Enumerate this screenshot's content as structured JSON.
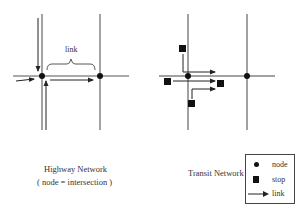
{
  "highway": {
    "title": "Highway Network",
    "subtitle": "( node = intersection )",
    "link_label": "link"
  },
  "transit": {
    "title": "Transit Network"
  },
  "legend": {
    "items": [
      {
        "symbol": "circle",
        "label": "node"
      },
      {
        "symbol": "square",
        "label": "stop"
      },
      {
        "symbol": "arrow",
        "label": "link"
      }
    ]
  },
  "colors": {
    "line": "#555555",
    "node": "#111111",
    "arrow": "#222222",
    "text": "#333333"
  }
}
